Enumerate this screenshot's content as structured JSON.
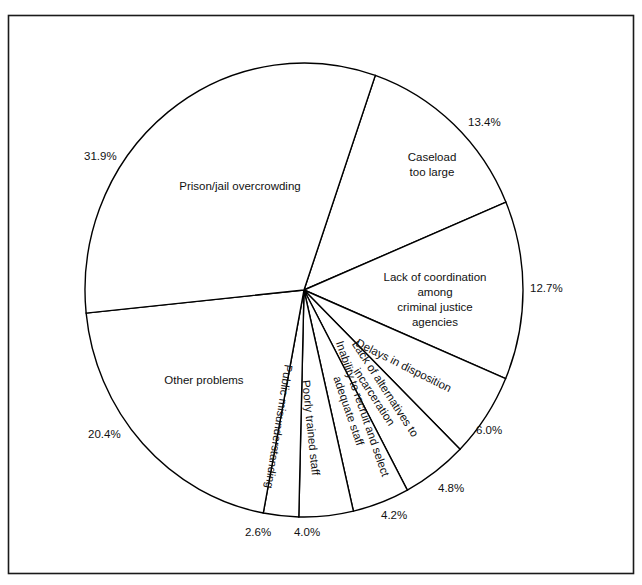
{
  "chart_data": {
    "type": "pie",
    "title": "",
    "subtitle": "",
    "xlabel": "",
    "ylabel": "",
    "legend_position": "none",
    "grid": false,
    "value_unit": "percent",
    "total": 100.0,
    "categories": [
      "Caseload too large",
      "Lack of coordination among criminal justice agencies",
      "Delays in disposition",
      "Lack of alternatives to incarceration",
      "Inability to recruit and select adequate staff",
      "Poorly trained staff",
      "Public misunderstanding",
      "Other problems",
      "Prison/jail overcrowding"
    ],
    "values": [
      13.4,
      12.7,
      6.0,
      4.8,
      4.2,
      4.0,
      2.6,
      20.4,
      31.9
    ],
    "slices": [
      {
        "label": "Caseload too large",
        "label_lines": [
          "Caseload",
          "too large"
        ],
        "value": 13.4,
        "pct_text": "13.4%",
        "label_rotated": false
      },
      {
        "label": "Lack of coordination among criminal justice agencies",
        "label_lines": [
          "Lack of coordination",
          "among",
          "criminal justice",
          "agencies"
        ],
        "value": 12.7,
        "pct_text": "12.7%",
        "label_rotated": false
      },
      {
        "label": "Delays in disposition",
        "label_lines": [
          "Delays in disposition"
        ],
        "value": 6.0,
        "pct_text": "6.0%",
        "label_rotated": true
      },
      {
        "label": "Lack of alternatives to incarceration",
        "label_lines": [
          "Lack  of alternatives to",
          "incarceration"
        ],
        "value": 4.8,
        "pct_text": "4.8%",
        "label_rotated": true
      },
      {
        "label": "Inability to recruit and select adequate staff",
        "label_lines": [
          "Inability to recruit and select",
          "adequate staff"
        ],
        "value": 4.2,
        "pct_text": "4.2%",
        "label_rotated": true
      },
      {
        "label": "Poorly trained staff",
        "label_lines": [
          "Poorly trained staff"
        ],
        "value": 4.0,
        "pct_text": "4.0%",
        "label_rotated": true
      },
      {
        "label": "Public misunderstanding",
        "label_lines": [
          "Public misunderstanding"
        ],
        "value": 2.6,
        "pct_text": "2.6%",
        "label_rotated": true
      },
      {
        "label": "Other problems",
        "label_lines": [
          "Other problems"
        ],
        "value": 20.4,
        "pct_text": "20.4%",
        "label_rotated": false
      },
      {
        "label": "Prison/jail overcrowding",
        "label_lines": [
          "Prison/jail overcrowding"
        ],
        "value": 31.9,
        "pct_text": "31.9%",
        "label_rotated": false
      }
    ]
  },
  "labels": {
    "caseload_l1": "Caseload",
    "caseload_l2": "too large",
    "coordination_l1": "Lack of coordination",
    "coordination_l2": "among",
    "coordination_l3": "criminal justice",
    "coordination_l4": "agencies",
    "delays": "Delays in disposition",
    "alternatives_l1": "Lack  of alternatives to",
    "alternatives_l2": "incarceration",
    "recruit_l1": "Inability to recruit and select",
    "recruit_l2": "adequate staff",
    "poorly_trained": "Poorly trained staff",
    "public_misunderstanding": "Public misunderstanding",
    "other_problems": "Other problems",
    "prison_overcrowding": "Prison/jail overcrowding"
  },
  "percents": {
    "caseload": "13.4%",
    "coordination": "12.7%",
    "delays": "6.0%",
    "alternatives": "4.8%",
    "recruit": "4.2%",
    "poorly_trained": "4.0%",
    "public_misunderstanding": "2.6%",
    "other_problems": "20.4%",
    "prison_overcrowding": "31.9%"
  },
  "style": {
    "stroke_color": "#000000",
    "fill_color": "#ffffff",
    "text_color": "#111111",
    "frame_color": "#1a1a1a",
    "background": "#ffffff"
  }
}
